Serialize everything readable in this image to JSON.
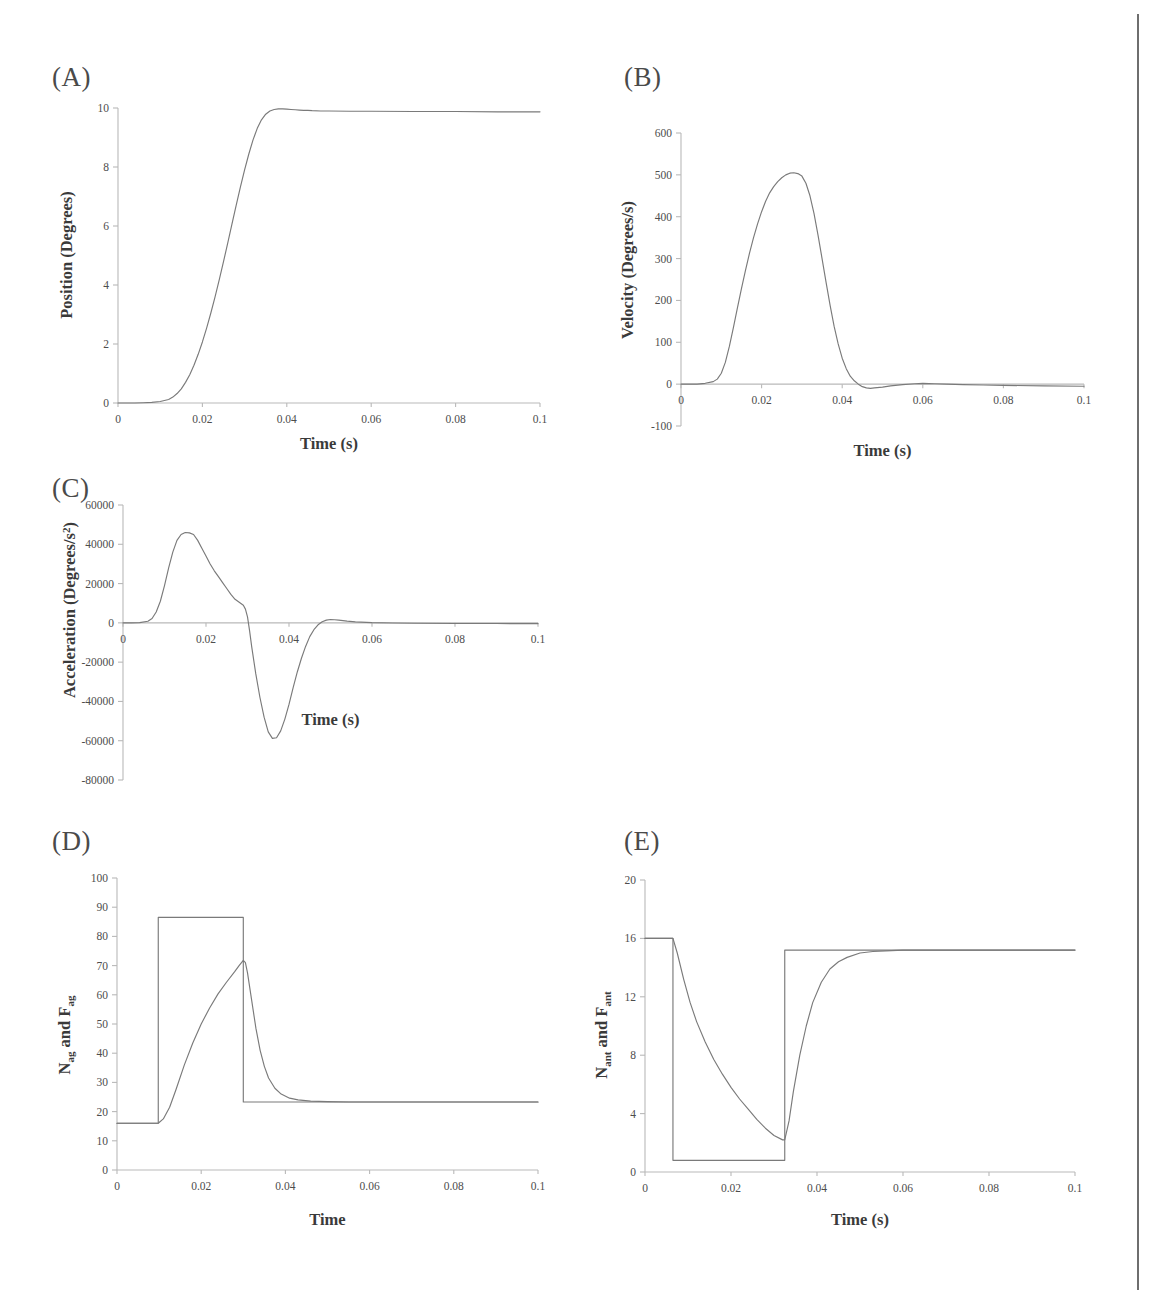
{
  "figure": {
    "background_color": "#ffffff",
    "curve_color": "#7a7a7a",
    "axis_color": "#b9b9b9",
    "text_color": "#4d4d4d",
    "page_rule_color": "#6e6e6e"
  },
  "panels": [
    {
      "id": "A",
      "label": "(A)",
      "xlabel": "Time (s)",
      "ylabel": "Position (Degrees)"
    },
    {
      "id": "B",
      "label": "(B)",
      "xlabel": "Time (s)",
      "ylabel": "Velocity (Degrees/s)"
    },
    {
      "id": "C",
      "label": "(C)",
      "xlabel": "Time (s)",
      "ylabel_pre": "Acceleration (Degrees/s",
      "ylabel_sup": "2",
      "ylabel_post": ")"
    },
    {
      "id": "D",
      "label": "(D)",
      "xlabel": "Time",
      "ylabel_n": "N",
      "ylabel_n_sub": "ag",
      "ylabel_mid": " and F",
      "ylabel_f_sub": "ag"
    },
    {
      "id": "E",
      "label": "(E)",
      "xlabel": "Time (s)",
      "ylabel_n": "N",
      "ylabel_n_sub": "ant",
      "ylabel_mid": " and F",
      "ylabel_f_sub": "ant"
    }
  ],
  "chart_data": [
    {
      "panel": "A",
      "type": "line",
      "title": "(A)",
      "xlabel": "Time (s)",
      "ylabel": "Position (Degrees)",
      "xlim": [
        0,
        0.1
      ],
      "ylim": [
        0,
        10
      ],
      "xticks": [
        0,
        0.02,
        0.04,
        0.06,
        0.08,
        0.1
      ],
      "xticklabels": [
        "0",
        "0.02",
        "0.04",
        "0.06",
        "0.08",
        "0.1"
      ],
      "yticks": [
        0,
        2,
        4,
        6,
        8,
        10
      ],
      "yticklabels": [
        "0",
        "2",
        "4",
        "6",
        "8",
        "10"
      ],
      "grid": false,
      "legend": "none",
      "series": [
        {
          "name": "Position",
          "x": [
            0,
            0.002,
            0.004,
            0.006,
            0.008,
            0.01,
            0.012,
            0.013,
            0.014,
            0.015,
            0.016,
            0.017,
            0.018,
            0.019,
            0.02,
            0.021,
            0.022,
            0.023,
            0.024,
            0.025,
            0.026,
            0.027,
            0.028,
            0.029,
            0.03,
            0.031,
            0.032,
            0.033,
            0.034,
            0.035,
            0.036,
            0.037,
            0.038,
            0.039,
            0.04,
            0.041,
            0.042,
            0.043,
            0.044,
            0.045,
            0.046,
            0.048,
            0.05,
            0.055,
            0.06,
            0.07,
            0.08,
            0.09,
            0.1
          ],
          "y": [
            0,
            0,
            0,
            0.01,
            0.02,
            0.05,
            0.12,
            0.2,
            0.32,
            0.48,
            0.7,
            0.96,
            1.28,
            1.65,
            2.07,
            2.54,
            3.05,
            3.6,
            4.18,
            4.79,
            5.42,
            6.06,
            6.7,
            7.32,
            7.9,
            8.44,
            8.92,
            9.31,
            9.6,
            9.79,
            9.9,
            9.95,
            9.97,
            9.97,
            9.96,
            9.95,
            9.94,
            9.93,
            9.92,
            9.92,
            9.91,
            9.9,
            9.9,
            9.89,
            9.89,
            9.88,
            9.88,
            9.87,
            9.87
          ]
        }
      ]
    },
    {
      "panel": "B",
      "type": "line",
      "title": "(B)",
      "xlabel": "Time (s)",
      "ylabel": "Velocity (Degrees/s)",
      "xlim": [
        0,
        0.1
      ],
      "ylim": [
        -100,
        600
      ],
      "xticks": [
        0,
        0.02,
        0.04,
        0.06,
        0.08,
        0.1
      ],
      "xticklabels": [
        "0",
        "0.02",
        "0.04",
        "0.06",
        "0.08",
        "0.1"
      ],
      "yticks": [
        -100,
        0,
        100,
        200,
        300,
        400,
        500,
        600
      ],
      "yticklabels": [
        "-100",
        "0",
        "100",
        "200",
        "300",
        "400",
        "500",
        "600"
      ],
      "grid": false,
      "legend": "none",
      "peak_value": 505,
      "peak_time": 0.031,
      "series": [
        {
          "name": "Velocity",
          "x": [
            0,
            0.002,
            0.004,
            0.006,
            0.008,
            0.009,
            0.01,
            0.011,
            0.012,
            0.013,
            0.014,
            0.015,
            0.016,
            0.017,
            0.018,
            0.019,
            0.02,
            0.021,
            0.022,
            0.023,
            0.024,
            0.025,
            0.026,
            0.027,
            0.028,
            0.029,
            0.03,
            0.031,
            0.032,
            0.033,
            0.034,
            0.035,
            0.036,
            0.037,
            0.038,
            0.039,
            0.04,
            0.041,
            0.042,
            0.043,
            0.044,
            0.045,
            0.046,
            0.047,
            0.048,
            0.05,
            0.052,
            0.055,
            0.058,
            0.06,
            0.063,
            0.066,
            0.07,
            0.075,
            0.08,
            0.09,
            0.1
          ],
          "y": [
            0,
            0,
            0,
            2,
            6,
            12,
            26,
            52,
            90,
            135,
            182,
            228,
            272,
            313,
            350,
            383,
            412,
            437,
            457,
            472,
            484,
            493,
            500,
            504,
            505,
            503,
            497,
            480,
            450,
            408,
            356,
            300,
            243,
            188,
            138,
            96,
            62,
            37,
            19,
            8,
            0,
            -6,
            -9,
            -10,
            -9,
            -7,
            -4,
            -1,
            1,
            2,
            1,
            0,
            -1,
            -2,
            -3,
            -4,
            -5
          ]
        }
      ]
    },
    {
      "panel": "C",
      "type": "line",
      "title": "(C)",
      "xlabel": "Time (s)",
      "ylabel": "Acceleration (Degrees/s2)",
      "xlim": [
        0,
        0.1
      ],
      "ylim": [
        -80000,
        60000
      ],
      "xticks": [
        0,
        0.02,
        0.04,
        0.06,
        0.08,
        0.1
      ],
      "xticklabels": [
        "0",
        "0.02",
        "0.04",
        "0.06",
        "0.08",
        "0.1"
      ],
      "yticks": [
        -80000,
        -60000,
        -40000,
        -20000,
        0,
        20000,
        40000,
        60000
      ],
      "yticklabels": [
        "-80000",
        "-60000",
        "-40000",
        "-20000",
        "0",
        "20000",
        "40000",
        "60000"
      ],
      "grid": false,
      "legend": "none",
      "peak_value": 46000,
      "peak_time": 0.017,
      "trough_value": -59000,
      "trough_time": 0.036,
      "series": [
        {
          "name": "Acceleration",
          "x": [
            0,
            0.002,
            0.004,
            0.006,
            0.007,
            0.008,
            0.009,
            0.01,
            0.011,
            0.012,
            0.013,
            0.014,
            0.015,
            0.016,
            0.017,
            0.018,
            0.019,
            0.02,
            0.021,
            0.022,
            0.023,
            0.024,
            0.025,
            0.026,
            0.027,
            0.028,
            0.029,
            0.0295,
            0.03,
            0.0305,
            0.031,
            0.032,
            0.033,
            0.034,
            0.035,
            0.036,
            0.037,
            0.038,
            0.039,
            0.04,
            0.041,
            0.042,
            0.043,
            0.044,
            0.045,
            0.046,
            0.047,
            0.048,
            0.049,
            0.05,
            0.051,
            0.052,
            0.054,
            0.056,
            0.06,
            0.065,
            0.07,
            0.08,
            0.09,
            0.1
          ],
          "y": [
            0,
            0,
            100,
            800,
            2200,
            5500,
            11000,
            19000,
            28000,
            36000,
            42000,
            45000,
            46000,
            45800,
            45000,
            42000,
            38000,
            34000,
            30000,
            26500,
            23500,
            20500,
            17500,
            14500,
            12000,
            10500,
            9000,
            7000,
            3000,
            -4000,
            -12000,
            -26000,
            -38000,
            -48000,
            -55500,
            -58800,
            -58500,
            -55000,
            -49000,
            -41500,
            -33000,
            -25000,
            -18000,
            -12000,
            -7000,
            -3500,
            -1000,
            600,
            1400,
            1700,
            1600,
            1400,
            900,
            500,
            100,
            -100,
            -200,
            -300,
            -350,
            -400
          ]
        }
      ]
    },
    {
      "panel": "D",
      "type": "line",
      "title": "(D)",
      "xlabel": "Time",
      "ylabel": "Nag and Fag",
      "xlim": [
        0,
        0.1
      ],
      "ylim": [
        0,
        100
      ],
      "xticks": [
        0,
        0.02,
        0.04,
        0.06,
        0.08,
        0.1
      ],
      "xticklabels": [
        "0",
        "0.02",
        "0.04",
        "0.06",
        "0.08",
        "0.1"
      ],
      "yticks": [
        0,
        10,
        20,
        30,
        40,
        50,
        60,
        70,
        80,
        90,
        100
      ],
      "yticklabels": [
        "0",
        "10",
        "20",
        "30",
        "40",
        "50",
        "60",
        "70",
        "80",
        "90",
        "100"
      ],
      "grid": false,
      "legend": "none",
      "pulse_baseline": 16,
      "pulse_high": 86.5,
      "pulse_final": 23.3,
      "pulse_start": 0.0098,
      "pulse_end": 0.03,
      "filtered_peak": 71.8,
      "series": [
        {
          "name": "N_ag (neural input pulse)",
          "x": [
            0,
            0.0098,
            0.0098,
            0.03,
            0.03,
            0.1
          ],
          "y": [
            16,
            16,
            86.5,
            86.5,
            23.3,
            23.3
          ]
        },
        {
          "name": "F_ag (muscle force)",
          "x": [
            0,
            0.004,
            0.008,
            0.0098,
            0.011,
            0.0125,
            0.014,
            0.016,
            0.018,
            0.02,
            0.022,
            0.024,
            0.026,
            0.028,
            0.029,
            0.03,
            0.0305,
            0.031,
            0.032,
            0.033,
            0.034,
            0.035,
            0.036,
            0.0375,
            0.039,
            0.041,
            0.043,
            0.046,
            0.05,
            0.055,
            0.06,
            0.07,
            0.08,
            0.09,
            0.1
          ],
          "y": [
            16,
            16,
            16,
            16,
            17.5,
            21.5,
            27.5,
            36.0,
            43.5,
            50.0,
            55.5,
            60.3,
            64.3,
            68.0,
            70.0,
            71.8,
            71.0,
            67.5,
            58.0,
            48.5,
            41.0,
            35.5,
            31.5,
            28.0,
            26.0,
            24.6,
            24.0,
            23.6,
            23.4,
            23.3,
            23.3,
            23.3,
            23.3,
            23.3,
            23.3
          ]
        }
      ]
    },
    {
      "panel": "E",
      "type": "line",
      "title": "(E)",
      "xlabel": "Time (s)",
      "ylabel": "Nant and Fant",
      "xlim": [
        0,
        0.1
      ],
      "ylim": [
        0,
        20
      ],
      "xticks": [
        0,
        0.02,
        0.04,
        0.06,
        0.08,
        0.1
      ],
      "xticklabels": [
        "0",
        "0.02",
        "0.04",
        "0.06",
        "0.08",
        "0.1"
      ],
      "yticks": [
        0,
        4,
        8,
        12,
        16,
        20
      ],
      "yticklabels": [
        "0",
        "4",
        "8",
        "12",
        "16",
        "20"
      ],
      "grid": false,
      "legend": "none",
      "pulse_baseline": 16,
      "pulse_low": 0.8,
      "pulse_final": 15.2,
      "pulse_start": 0.0065,
      "pulse_end": 0.0325,
      "filtered_trough": 2.2,
      "series": [
        {
          "name": "N_ant (neural input pulse)",
          "x": [
            0,
            0.0065,
            0.0065,
            0.0325,
            0.0325,
            0.1
          ],
          "y": [
            16,
            16,
            0.8,
            0.8,
            15.2,
            15.2
          ]
        },
        {
          "name": "F_ant (muscle force)",
          "x": [
            0,
            0.003,
            0.0065,
            0.0075,
            0.009,
            0.0105,
            0.012,
            0.014,
            0.016,
            0.018,
            0.02,
            0.022,
            0.024,
            0.026,
            0.028,
            0.03,
            0.032,
            0.0325,
            0.0335,
            0.0345,
            0.036,
            0.0375,
            0.039,
            0.041,
            0.043,
            0.045,
            0.047,
            0.05,
            0.053,
            0.056,
            0.06,
            0.065,
            0.07,
            0.08,
            0.09,
            0.1
          ],
          "y": [
            16,
            16,
            16,
            15.0,
            13.2,
            11.6,
            10.3,
            8.9,
            7.7,
            6.7,
            5.8,
            5.0,
            4.3,
            3.6,
            3.0,
            2.5,
            2.2,
            2.2,
            3.5,
            5.5,
            8.0,
            10.0,
            11.6,
            13.0,
            13.9,
            14.4,
            14.7,
            15.0,
            15.1,
            15.15,
            15.2,
            15.2,
            15.2,
            15.2,
            15.2,
            15.2
          ]
        }
      ]
    }
  ]
}
